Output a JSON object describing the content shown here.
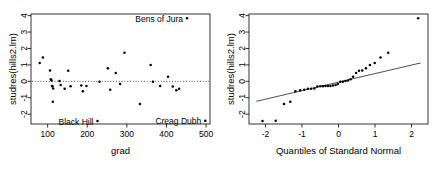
{
  "figure": {
    "title": "",
    "background": "#ffffff",
    "point_color": "#000000",
    "line_color": "#000000"
  },
  "chart_data": [
    {
      "type": "scatter",
      "panel": "left",
      "title": "",
      "xlabel": "grad",
      "ylabel": "studres(hills2.lm)",
      "xlim": [
        58,
        510
      ],
      "ylim": [
        -2.6,
        4.1
      ],
      "xticks": [
        100,
        200,
        300,
        400,
        500
      ],
      "yticks": [
        -2,
        -1,
        0,
        1,
        2,
        3,
        4
      ],
      "grid": false,
      "legend": "none",
      "reference_line": {
        "type": "horizontal",
        "y": 0,
        "style": "dotted"
      },
      "points": [
        {
          "x": 80,
          "y": 1.12
        },
        {
          "x": 88,
          "y": 1.45
        },
        {
          "x": 106,
          "y": 0.66
        },
        {
          "x": 108,
          "y": 0.12
        },
        {
          "x": 110,
          "y": 0.05
        },
        {
          "x": 111,
          "y": -0.28
        },
        {
          "x": 112,
          "y": -0.3
        },
        {
          "x": 113,
          "y": -1.25
        },
        {
          "x": 114,
          "y": -0.44
        },
        {
          "x": 130,
          "y": 0.02
        },
        {
          "x": 133,
          "y": -0.22
        },
        {
          "x": 143,
          "y": -0.45
        },
        {
          "x": 152,
          "y": 0.65
        },
        {
          "x": 158,
          "y": -0.3
        },
        {
          "x": 185,
          "y": -0.25
        },
        {
          "x": 189,
          "y": -0.6
        },
        {
          "x": 198,
          "y": -0.28
        },
        {
          "x": 226,
          "y": -2.42
        },
        {
          "x": 231,
          "y": -0.02
        },
        {
          "x": 252,
          "y": 0.8
        },
        {
          "x": 258,
          "y": -0.52
        },
        {
          "x": 272,
          "y": 0.5
        },
        {
          "x": 283,
          "y": -0.17
        },
        {
          "x": 294,
          "y": 1.74
        },
        {
          "x": 333,
          "y": -1.38
        },
        {
          "x": 360,
          "y": 1.0
        },
        {
          "x": 366,
          "y": -0.03
        },
        {
          "x": 384,
          "y": -0.28
        },
        {
          "x": 404,
          "y": 0.28
        },
        {
          "x": 416,
          "y": -0.32
        },
        {
          "x": 425,
          "y": -0.55
        },
        {
          "x": 432,
          "y": -0.46
        },
        {
          "x": 452,
          "y": 3.84
        },
        {
          "x": 498,
          "y": -2.4
        }
      ],
      "annotations": [
        {
          "text": "Bens of Jura",
          "x": 452,
          "y": 3.84,
          "placement": "left"
        },
        {
          "text": "Black Hill",
          "x": 226,
          "y": -2.42,
          "placement": "left"
        },
        {
          "text": "Creag Dubh",
          "x": 498,
          "y": -2.4,
          "placement": "left"
        }
      ]
    },
    {
      "type": "scatter",
      "panel": "right",
      "title": "",
      "xlabel": "Quantiles of Standard Normal",
      "ylabel": "studres(hills2.lm)",
      "xlim": [
        -2.45,
        2.45
      ],
      "ylim": [
        -2.6,
        4.1
      ],
      "xticks": [
        -2,
        -1,
        0,
        1,
        2
      ],
      "yticks": [
        -2,
        -1,
        0,
        1,
        2,
        3,
        4
      ],
      "grid": false,
      "legend": "none",
      "reference_line": {
        "type": "qq-line",
        "x": [
          -2.25,
          2.25
        ],
        "y": [
          -1.22,
          1.12
        ],
        "style": "solid"
      },
      "points": [
        {
          "x": -2.08,
          "y": -2.42
        },
        {
          "x": -1.72,
          "y": -2.4
        },
        {
          "x": -1.49,
          "y": -1.38
        },
        {
          "x": -1.32,
          "y": -1.25
        },
        {
          "x": -1.18,
          "y": -0.6
        },
        {
          "x": -1.05,
          "y": -0.55
        },
        {
          "x": -0.94,
          "y": -0.52
        },
        {
          "x": -0.84,
          "y": -0.46
        },
        {
          "x": -0.75,
          "y": -0.45
        },
        {
          "x": -0.66,
          "y": -0.44
        },
        {
          "x": -0.58,
          "y": -0.32
        },
        {
          "x": -0.5,
          "y": -0.3
        },
        {
          "x": -0.43,
          "y": -0.3
        },
        {
          "x": -0.36,
          "y": -0.28
        },
        {
          "x": -0.29,
          "y": -0.28
        },
        {
          "x": -0.22,
          "y": -0.28
        },
        {
          "x": -0.15,
          "y": -0.25
        },
        {
          "x": -0.08,
          "y": -0.22
        },
        {
          "x": -0.02,
          "y": -0.17
        },
        {
          "x": 0.05,
          "y": -0.03
        },
        {
          "x": 0.12,
          "y": -0.02
        },
        {
          "x": 0.19,
          "y": 0.02
        },
        {
          "x": 0.26,
          "y": 0.05
        },
        {
          "x": 0.33,
          "y": 0.12
        },
        {
          "x": 0.4,
          "y": 0.28
        },
        {
          "x": 0.48,
          "y": 0.5
        },
        {
          "x": 0.56,
          "y": 0.65
        },
        {
          "x": 0.65,
          "y": 0.66
        },
        {
          "x": 0.75,
          "y": 0.8
        },
        {
          "x": 0.86,
          "y": 1.0
        },
        {
          "x": 0.99,
          "y": 1.12
        },
        {
          "x": 1.15,
          "y": 1.45
        },
        {
          "x": 1.36,
          "y": 1.74
        },
        {
          "x": 2.18,
          "y": 3.84
        }
      ],
      "annotations": []
    }
  ]
}
